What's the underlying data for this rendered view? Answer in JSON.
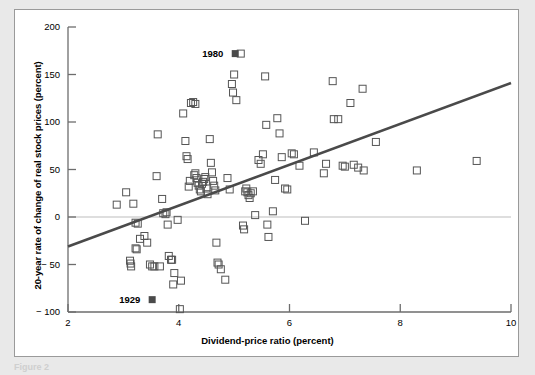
{
  "figure": {
    "background_color": "#e9e9e9",
    "panel_color": "#ffffff",
    "panel_border_color": "#9a9a9a",
    "caption_partial": "Figure 2"
  },
  "chart_data": {
    "type": "scatter",
    "title": "",
    "subtitle": "",
    "xlabel": "Dividend-price ratio (percent)",
    "ylabel": "20-year rate of change of real stock prices (percent)",
    "xlim": [
      2,
      10
    ],
    "ylim": [
      -100,
      200
    ],
    "xticks": [
      2,
      4,
      6,
      8,
      10
    ],
    "yticks": [
      200,
      150,
      100,
      50,
      0,
      -50,
      -100
    ],
    "xtick_labels": [
      "2",
      "4",
      "6",
      "8",
      "10"
    ],
    "ytick_labels": [
      "200",
      "150",
      "100",
      "50",
      "0",
      "− 50",
      "− 100"
    ],
    "grid": false,
    "legend": null,
    "zero_line": {
      "y": 0,
      "color": "#bdbdbd",
      "width": 1
    },
    "marker": {
      "shape": "open-square",
      "size_px": 7,
      "edge_color": "#555555",
      "face_color": "none",
      "edge_width": 1
    },
    "highlight_marker": {
      "shape": "filled-square",
      "size_px": 7,
      "face_color": "#4a4a4a"
    },
    "trendline": {
      "type": "linear-fit",
      "color": "#4a4a4a",
      "width": 2.6,
      "x_start": 2,
      "y_start": -31,
      "x_end": 10,
      "y_end": 141
    },
    "annotations": [
      {
        "label": "1980",
        "x": 5.02,
        "y": 172,
        "text_anchor": "right-of-label",
        "highlight": true
      },
      {
        "label": "1929",
        "x": 3.52,
        "y": -87,
        "text_anchor": "right-of-label",
        "highlight": true
      }
    ],
    "points": [
      [
        2.88,
        13
      ],
      [
        3.05,
        26
      ],
      [
        3.18,
        14
      ],
      [
        3.22,
        -6
      ],
      [
        3.26,
        -7
      ],
      [
        3.3,
        -23
      ],
      [
        3.12,
        -46
      ],
      [
        3.13,
        -49
      ],
      [
        3.14,
        -52
      ],
      [
        3.22,
        -33
      ],
      [
        3.24,
        -34
      ],
      [
        3.38,
        -20
      ],
      [
        3.43,
        -27
      ],
      [
        3.48,
        -50
      ],
      [
        3.52,
        -52
      ],
      [
        3.56,
        -52
      ],
      [
        3.66,
        -52
      ],
      [
        3.6,
        43
      ],
      [
        3.62,
        87
      ],
      [
        3.7,
        19
      ],
      [
        3.72,
        4
      ],
      [
        3.76,
        3
      ],
      [
        3.78,
        5
      ],
      [
        3.8,
        -8
      ],
      [
        3.82,
        -41
      ],
      [
        3.86,
        -45
      ],
      [
        3.88,
        -45
      ],
      [
        3.9,
        -71
      ],
      [
        3.92,
        -59
      ],
      [
        3.98,
        -3
      ],
      [
        4.02,
        -97
      ],
      [
        4.04,
        -67
      ],
      [
        4.08,
        109
      ],
      [
        4.12,
        80
      ],
      [
        4.14,
        64
      ],
      [
        4.16,
        61
      ],
      [
        4.18,
        32
      ],
      [
        4.2,
        38
      ],
      [
        4.22,
        120
      ],
      [
        4.26,
        121
      ],
      [
        4.3,
        119
      ],
      [
        4.28,
        44
      ],
      [
        4.3,
        46
      ],
      [
        4.32,
        41
      ],
      [
        4.34,
        36
      ],
      [
        4.36,
        33
      ],
      [
        4.38,
        29
      ],
      [
        4.4,
        27
      ],
      [
        4.42,
        35
      ],
      [
        4.44,
        37
      ],
      [
        4.46,
        40
      ],
      [
        4.48,
        42
      ],
      [
        4.5,
        30
      ],
      [
        4.52,
        24
      ],
      [
        4.56,
        82
      ],
      [
        4.58,
        57
      ],
      [
        4.6,
        47
      ],
      [
        4.62,
        38
      ],
      [
        4.64,
        33
      ],
      [
        4.66,
        28
      ],
      [
        4.68,
        -27
      ],
      [
        4.7,
        -48
      ],
      [
        4.72,
        -50
      ],
      [
        4.76,
        -55
      ],
      [
        4.84,
        -66
      ],
      [
        4.88,
        41
      ],
      [
        4.92,
        29
      ],
      [
        4.96,
        140
      ],
      [
        4.98,
        131
      ],
      [
        5.0,
        150
      ],
      [
        5.04,
        123
      ],
      [
        5.12,
        172
      ],
      [
        5.16,
        -9
      ],
      [
        5.18,
        -13
      ],
      [
        5.2,
        27
      ],
      [
        5.22,
        30
      ],
      [
        5.24,
        26
      ],
      [
        5.26,
        23
      ],
      [
        5.28,
        20
      ],
      [
        5.3,
        25
      ],
      [
        5.34,
        27
      ],
      [
        5.38,
        2
      ],
      [
        5.44,
        60
      ],
      [
        5.48,
        56
      ],
      [
        5.52,
        66
      ],
      [
        5.56,
        148
      ],
      [
        5.58,
        97
      ],
      [
        5.6,
        -8
      ],
      [
        5.62,
        -21
      ],
      [
        5.7,
        6
      ],
      [
        5.74,
        39
      ],
      [
        5.78,
        104
      ],
      [
        5.82,
        88
      ],
      [
        5.86,
        63
      ],
      [
        5.92,
        30
      ],
      [
        5.96,
        29
      ],
      [
        6.04,
        67
      ],
      [
        6.08,
        66
      ],
      [
        6.18,
        54
      ],
      [
        6.28,
        -4
      ],
      [
        6.44,
        68
      ],
      [
        6.62,
        46
      ],
      [
        6.66,
        56
      ],
      [
        6.78,
        143
      ],
      [
        6.8,
        103
      ],
      [
        6.88,
        103
      ],
      [
        6.96,
        54
      ],
      [
        7.0,
        53
      ],
      [
        7.1,
        120
      ],
      [
        7.16,
        55
      ],
      [
        7.24,
        52
      ],
      [
        7.32,
        135
      ],
      [
        7.34,
        49
      ],
      [
        7.56,
        79
      ],
      [
        8.3,
        49
      ],
      [
        9.38,
        59
      ]
    ]
  }
}
